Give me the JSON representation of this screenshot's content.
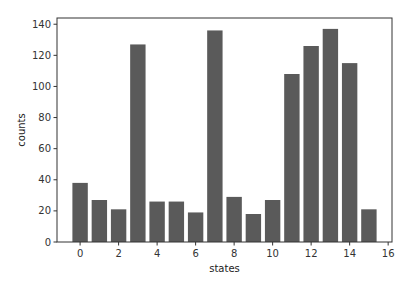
{
  "chart_data": {
    "type": "bar",
    "title": "",
    "xlabel": "states",
    "ylabel": "counts",
    "categories": [
      0,
      1,
      2,
      3,
      4,
      5,
      6,
      7,
      8,
      9,
      10,
      11,
      12,
      13,
      14,
      15
    ],
    "values": [
      38,
      27,
      21,
      127,
      26,
      26,
      19,
      136,
      29,
      18,
      27,
      108,
      126,
      137,
      115,
      21
    ],
    "xticks": [
      0,
      2,
      4,
      6,
      8,
      10,
      12,
      14,
      16
    ],
    "yticks": [
      0,
      20,
      40,
      60,
      80,
      100,
      120,
      140
    ],
    "xlim": [
      -1.2,
      16.2
    ],
    "ylim": [
      0,
      144
    ],
    "grid": false,
    "legend": null,
    "bar_color": "#5a5a5a"
  }
}
